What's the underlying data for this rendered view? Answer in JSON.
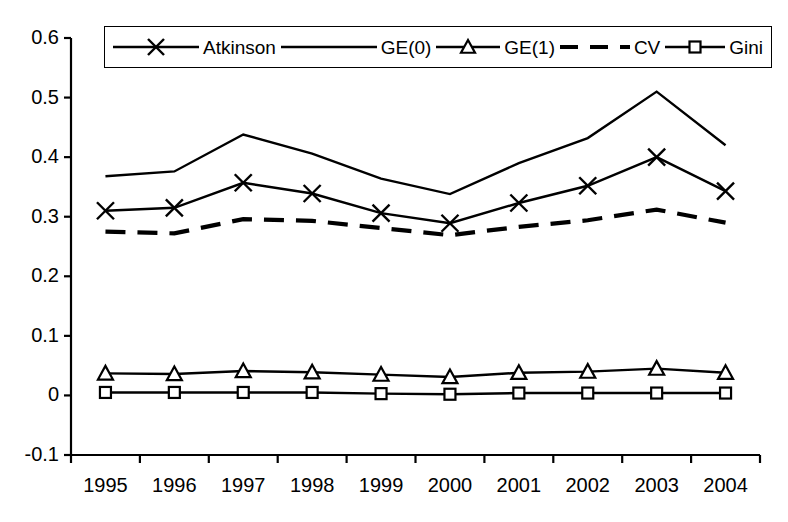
{
  "chart_data": {
    "type": "line",
    "title": "",
    "xlabel": "",
    "ylabel": "",
    "categories": [
      "1995",
      "1996",
      "1997",
      "1998",
      "1999",
      "2000",
      "2001",
      "2002",
      "2003",
      "2004"
    ],
    "ylim": [
      -0.1,
      0.6
    ],
    "ytick_labels": [
      "0.6",
      "0.5",
      "0.4",
      "0.3",
      "0.2",
      "0.1",
      "0",
      "-0.1"
    ],
    "ytick_values": [
      0.6,
      0.5,
      0.4,
      0.3,
      0.2,
      0.1,
      0,
      -0.1
    ],
    "grid": false,
    "legend_position": "top-center",
    "series": [
      {
        "name": "Atkinson",
        "marker": "x-cross",
        "dash": "solid",
        "values": [
          0.31,
          0.315,
          0.357,
          0.339,
          0.306,
          0.289,
          0.323,
          0.352,
          0.4,
          0.343
        ]
      },
      {
        "name": "GE(0)",
        "marker": "none",
        "dash": "solid",
        "values": [
          0.368,
          0.376,
          0.438,
          0.406,
          0.364,
          0.338,
          0.39,
          0.432,
          0.51,
          0.42
        ]
      },
      {
        "name": "GE(1)",
        "marker": "triangle",
        "dash": "solid",
        "values": [
          0.037,
          0.036,
          0.041,
          0.039,
          0.035,
          0.031,
          0.038,
          0.04,
          0.045,
          0.038
        ]
      },
      {
        "name": "CV",
        "marker": "none",
        "dash": "dashed",
        "values": [
          0.275,
          0.272,
          0.296,
          0.293,
          0.281,
          0.269,
          0.283,
          0.294,
          0.312,
          0.29
        ]
      },
      {
        "name": "Gini",
        "marker": "square",
        "dash": "solid",
        "values": [
          0.005,
          0.005,
          0.005,
          0.005,
          0.003,
          0.002,
          0.004,
          0.004,
          0.004,
          0.004
        ]
      }
    ]
  },
  "legend": {
    "entries": [
      {
        "label": "Atkinson",
        "marker": "x-cross",
        "dash": "solid"
      },
      {
        "label": "GE(0)",
        "marker": "none",
        "dash": "solid"
      },
      {
        "label": "GE(1)",
        "marker": "triangle",
        "dash": "solid"
      },
      {
        "label": "CV",
        "marker": "none",
        "dash": "dashed"
      },
      {
        "label": "Gini",
        "marker": "square",
        "dash": "solid"
      }
    ]
  },
  "axes": {
    "y_axis_name": "y-axis",
    "x_axis_name": "x-axis"
  }
}
